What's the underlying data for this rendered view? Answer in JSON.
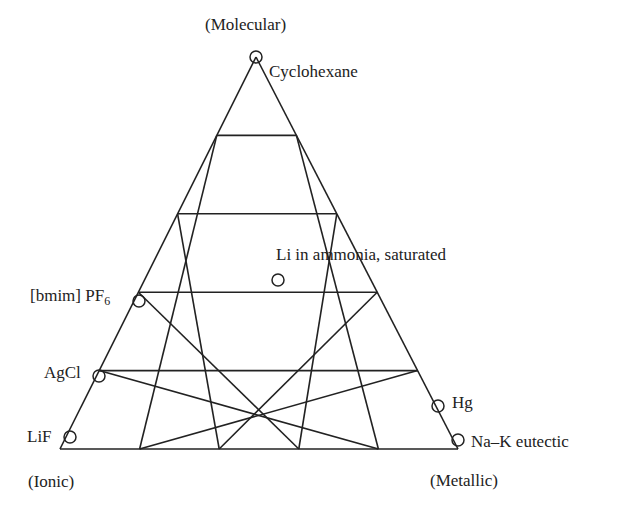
{
  "diagram": {
    "type": "ternary-triangle",
    "divisions": 5,
    "vertices": {
      "top": {
        "label": "(Molecular)",
        "x": 256,
        "y": 57
      },
      "left": {
        "label": "(Ionic)",
        "x": 60,
        "y": 449
      },
      "right": {
        "label": "(Metallic)",
        "x": 458,
        "y": 449
      }
    },
    "line_color": "#222222",
    "points": [
      {
        "label": "Cyclohexane",
        "x": 256,
        "y": 57
      },
      {
        "label": "Li in ammonia, saturated",
        "x": 278,
        "y": 280
      },
      {
        "label": "[bmim] PF",
        "subscript": "6",
        "x": 139,
        "y": 301
      },
      {
        "label": "AgCl",
        "x": 99,
        "y": 376
      },
      {
        "label": "LiF",
        "x": 70,
        "y": 437
      },
      {
        "label": "Hg",
        "x": 438,
        "y": 406
      },
      {
        "label": "Na–K eutectic",
        "x": 458,
        "y": 440
      }
    ]
  }
}
